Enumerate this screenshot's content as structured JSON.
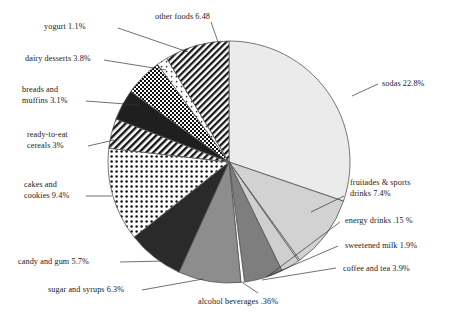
{
  "chart_data": {
    "type": "pie",
    "title": "",
    "subtitle": "",
    "xlabel": "",
    "ylabel": "",
    "legend_position": "none",
    "grid": false,
    "units": "percent of added sugars intake",
    "start_angle_deg": 0,
    "direction": "clockwise",
    "categories": [
      "sodas",
      "fruitades & sports drinks",
      "energy drinks",
      "sweetened milk",
      "coffee and tea",
      "alcohol beverages",
      "sugar and syrups",
      "candy and gum",
      "cakes and cookies",
      "ready-to-eat cereals",
      "breads and muffins",
      "dairy desserts",
      "yogurt",
      "other foods"
    ],
    "values": [
      22.8,
      7.4,
      0.15,
      1.9,
      3.9,
      0.36,
      6.3,
      5.7,
      9.4,
      3.0,
      3.1,
      3.8,
      1.1,
      6.48
    ],
    "slices": [
      {
        "label": "sodas 22.8%",
        "name": "sodas",
        "value": 22.8,
        "fill": "#ebebeb",
        "pattern": "solid"
      },
      {
        "label": "fruitades & sports drinks 7.4%",
        "name": "fruitades & sports drinks",
        "value": 7.4,
        "fill": "#d2d2d2",
        "pattern": "solid"
      },
      {
        "label": "energy drinks .15 %",
        "name": "energy drinks",
        "value": 0.15,
        "fill": "#ffffff",
        "pattern": "solid"
      },
      {
        "label": "sweetened milk 1.9%",
        "name": "sweetened milk",
        "value": 1.9,
        "fill": "#cfcfcf",
        "pattern": "solid"
      },
      {
        "label": "coffee and tea 3.9%",
        "name": "coffee and tea",
        "value": 3.9,
        "fill": "#7e7e7e",
        "pattern": "solid"
      },
      {
        "label": "alcohol beverages .36%",
        "name": "alcohol beverages",
        "value": 0.36,
        "fill": "#ffffff",
        "pattern": "solid"
      },
      {
        "label": "sugar and syrups 6.3%",
        "name": "sugar and syrups",
        "value": 6.3,
        "fill": "#8d8d8d",
        "pattern": "solid"
      },
      {
        "label": "candy and gum 5.7%",
        "name": "candy and gum",
        "value": 5.7,
        "fill": "#2a2a2a",
        "pattern": "solid"
      },
      {
        "label": "cakes and cookies 9.4%",
        "name": "cakes and cookies",
        "value": 9.4,
        "fill": "url(#pat-dots)",
        "pattern": "dots"
      },
      {
        "label": "ready-to-eat cereals 3%",
        "name": "ready-to-eat cereals",
        "value": 3.0,
        "fill": "url(#pat-diag)",
        "pattern": "diagonal-hatch"
      },
      {
        "label": "breads and muffins 3.1%",
        "name": "breads and muffins",
        "value": 3.1,
        "fill": "#1f1f1f",
        "pattern": "solid"
      },
      {
        "label": "dairy desserts 3.8%",
        "name": "dairy desserts",
        "value": 3.8,
        "fill": "url(#pat-check)",
        "pattern": "checker"
      },
      {
        "label": "yogurt 1.1%",
        "name": "yogurt",
        "value": 1.1,
        "fill": "url(#pat-lightdots)",
        "pattern": "light-dots"
      },
      {
        "label": "other foods 6.48",
        "name": "other foods",
        "value": 6.48,
        "fill": "url(#pat-diag2)",
        "pattern": "diagonal-hatch"
      }
    ],
    "labels": [
      {
        "key": "other_foods",
        "text": "other foods 6.48"
      },
      {
        "key": "yogurt",
        "text": "yogurt 1.1%"
      },
      {
        "key": "dairy_desserts",
        "text": "dairy desserts 3.8%"
      },
      {
        "key": "breads_muffins",
        "text": "breads and muffins 3.1%"
      },
      {
        "key": "cereals",
        "text": "ready-to-eat cereals 3%"
      },
      {
        "key": "cakes_cookies",
        "text": "cakes and cookies 9.4%"
      },
      {
        "key": "candy_gum",
        "text": "candy and gum 5.7%"
      },
      {
        "key": "sugar_syrups",
        "text": "sugar and syrups 6.3%"
      },
      {
        "key": "alcohol",
        "text": "alcohol beverages .36%"
      },
      {
        "key": "coffee_tea",
        "text": "coffee and tea 3.9%"
      },
      {
        "key": "sweetened_milk",
        "text": "sweetened milk 1.9%"
      },
      {
        "key": "energy_drinks",
        "text": "energy drinks .15 %"
      },
      {
        "key": "fruitades",
        "text": "fruitades & sports"
      },
      {
        "key": "fruitades_2",
        "text": "drinks 7.4%"
      },
      {
        "key": "sodas",
        "text": "sodas 22.8%"
      },
      {
        "key": "breads_1",
        "text": "breads and"
      },
      {
        "key": "breads_2",
        "text": "muffins 3.1%"
      },
      {
        "key": "cereals_1",
        "text": "ready-to-eat"
      },
      {
        "key": "cereals_2",
        "text": "cereals 3%"
      },
      {
        "key": "cakes_1",
        "text": "cakes and"
      },
      {
        "key": "cakes_2",
        "text": "cookies 9.4%"
      }
    ],
    "colors": {
      "outline": "#555555",
      "background": "#ffffff",
      "text": "#1a1a1a",
      "leader_line": "#333333"
    },
    "geometry": {
      "cx": 229,
      "cy": 162,
      "r": 121
    }
  }
}
